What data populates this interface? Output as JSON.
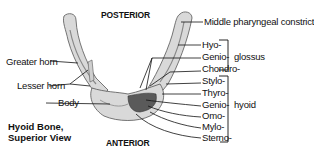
{
  "diagram": {
    "title_line1": "Hyoid Bone,",
    "title_line2": "Superior View",
    "orientation": {
      "top": "POSTERIOR",
      "bottom": "ANTERIOR"
    },
    "left_labels": {
      "greater_horn": "Greater horn",
      "lesser_horn": "Lesser horn",
      "body": "Body"
    },
    "right_labels": {
      "middle_pharyngeal": "Middle pharyngeal constricto",
      "glossus_group": {
        "group_label": "glossus",
        "items": [
          "Hyo-",
          "Genio-",
          "Chondro-"
        ]
      },
      "hyoid_group": {
        "group_label": "hyoid",
        "items": [
          "Stylo-",
          "Thyro-",
          "Genio-",
          "Omo-",
          "Mylo-",
          "Sterno-"
        ]
      }
    },
    "colors": {
      "bone_fill": "#d9d9d9",
      "bone_shade": "#8a8a8a",
      "muscle_attachment": "#5a5a5a",
      "line": "#111111"
    }
  }
}
